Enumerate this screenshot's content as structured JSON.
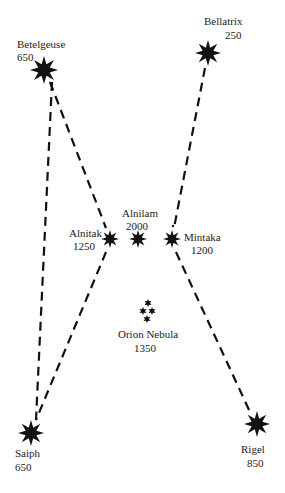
{
  "colors": {
    "ink": "#111111",
    "text": "#222222",
    "background": "#ffffff"
  },
  "stars": [
    {
      "id": "betelgeuse",
      "name": "Betelgeuse",
      "distance": "650",
      "x": 44,
      "y": 70,
      "r": 14
    },
    {
      "id": "bellatrix",
      "name": "Bellatrix",
      "distance": "250",
      "x": 208,
      "y": 53,
      "r": 13
    },
    {
      "id": "alnitak",
      "name": "Alnitak",
      "distance": "1250",
      "x": 110,
      "y": 239,
      "r": 9
    },
    {
      "id": "alnilam",
      "name": "Alnilam",
      "distance": "2000",
      "x": 138,
      "y": 239,
      "r": 9
    },
    {
      "id": "mintaka",
      "name": "Mintaka",
      "distance": "1200",
      "x": 172,
      "y": 239,
      "r": 9
    },
    {
      "id": "saiph",
      "name": "Saiph",
      "distance": "650",
      "x": 31,
      "y": 433,
      "r": 13
    },
    {
      "id": "rigel",
      "name": "Rigel",
      "distance": "850",
      "x": 257,
      "y": 424,
      "r": 13
    }
  ],
  "nebula": {
    "name": "Orion Nebula",
    "distance": "1350"
  },
  "lines": [
    {
      "from": "betelgeuse",
      "to": "saiph",
      "style": "dashed"
    },
    {
      "from": "bellatrix",
      "to": "rigel",
      "style": "dashed"
    }
  ]
}
